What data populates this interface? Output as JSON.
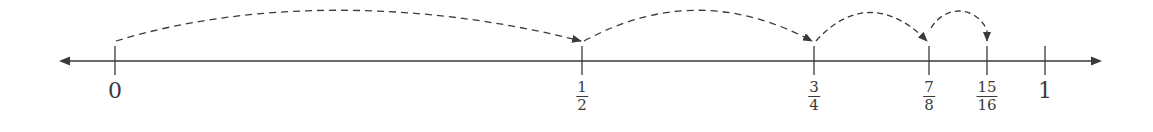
{
  "diagram": {
    "type": "number-line",
    "axis": {
      "y": 61,
      "x_start": 59,
      "x_end": 1102,
      "color": "#3a3a3a"
    },
    "ticks": [
      {
        "id": "zero",
        "x": 115,
        "kind": "whole",
        "value": "0"
      },
      {
        "id": "half",
        "x": 582,
        "kind": "frac",
        "num": "1",
        "den": "2"
      },
      {
        "id": "three-quarters",
        "x": 814,
        "kind": "frac",
        "num": "3",
        "den": "4"
      },
      {
        "id": "seven-eighths",
        "x": 929,
        "kind": "frac",
        "num": "7",
        "den": "8"
      },
      {
        "id": "fifteen-sixteenths",
        "x": 987,
        "kind": "frac",
        "num": "15",
        "den": "16"
      },
      {
        "id": "one",
        "x": 1045,
        "kind": "whole",
        "value": "1"
      }
    ],
    "jumps": [
      {
        "from": "0",
        "to": "1/2"
      },
      {
        "from": "1/2",
        "to": "3/4"
      },
      {
        "from": "3/4",
        "to": "7/8"
      },
      {
        "from": "7/8",
        "to": "15/16"
      }
    ],
    "labels": {
      "zero": "0",
      "half_num": "1",
      "half_den": "2",
      "tq_num": "3",
      "tq_den": "4",
      "se_num": "7",
      "se_den": "8",
      "fs_num": "15",
      "fs_den": "16",
      "one": "1"
    }
  }
}
